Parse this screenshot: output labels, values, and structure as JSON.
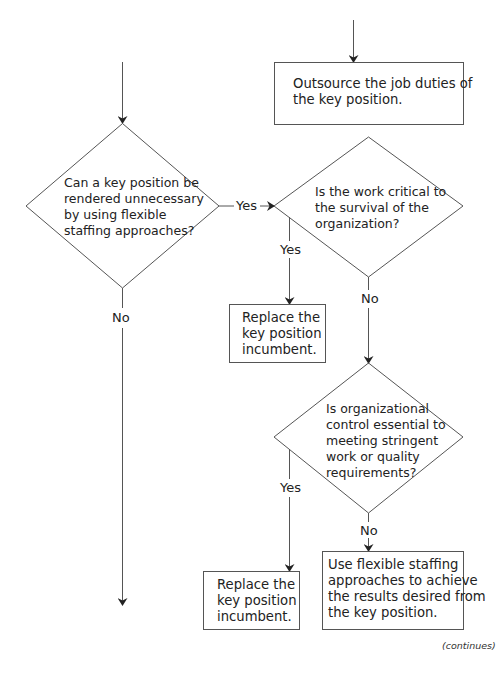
{
  "nodes": {
    "outsource_box": {
      "text": "Outsource the job duties of\nthe key position."
    },
    "decision_flexible": {
      "text": "Can a key position be\nrendered unnecessary\nby using flexible\nstaffing approaches?"
    },
    "decision_critical": {
      "text": "Is the work critical to\nthe survival of the\norganization?"
    },
    "replace_box_1": {
      "text": "Replace the\nkey position\nincumbent."
    },
    "decision_control": {
      "text": "Is organizational\ncontrol essential to\nmeeting stringent\nwork or quality\nrequirements?"
    },
    "replace_box_2": {
      "text": "Replace the\nkey position\nincumbent."
    },
    "flexible_box": {
      "text": "Use flexible staffing\napproaches to achieve\nthe results desired from\nthe key position."
    }
  },
  "edges": {
    "flexible_yes": "Yes",
    "flexible_no": "No",
    "critical_yes": "Yes",
    "critical_no": "No",
    "control_yes": "Yes",
    "control_no": "No"
  },
  "footer": {
    "continues": "(continues)"
  },
  "colors": {
    "line": "#444444",
    "text": "#222222",
    "background": "#ffffff"
  }
}
